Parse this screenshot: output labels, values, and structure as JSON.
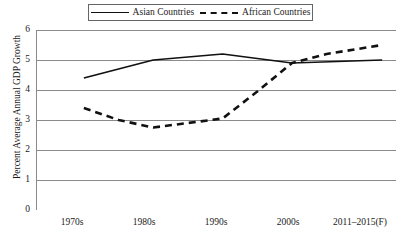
{
  "chart_data": {
    "type": "line",
    "title": "",
    "subtitle": "",
    "xlabel": "",
    "ylabel": "Percent Average Annual GDP Growth",
    "categories": [
      "1970s",
      "1980s",
      "1990s",
      "2000s",
      "2011–2015(F)"
    ],
    "ylim": [
      0,
      6
    ],
    "ytick_labels": [
      "6",
      "5",
      "4",
      "3",
      "2",
      "1",
      "0"
    ],
    "ytick_values": [
      6,
      5,
      4,
      3,
      2,
      1,
      0
    ],
    "grid": "horizontal",
    "grid_color": "#8a8a8a",
    "legend_position": "top-center",
    "series": [
      {
        "name": "Asian Countries",
        "style": "solid",
        "color": "#111111",
        "values": [
          4.4,
          5.0,
          5.2,
          4.9,
          5.0
        ],
        "points": [
          {
            "x": 1970,
            "y": 4.4
          },
          {
            "x": 1980,
            "y": 5.0
          },
          {
            "x": 1990,
            "y": 5.2
          },
          {
            "x": 2000,
            "y": 4.9
          },
          {
            "x": 2013,
            "y": 5.0
          }
        ]
      },
      {
        "name": "African Countries",
        "style": "dashed",
        "color": "#111111",
        "values": [
          3.4,
          2.75,
          3.05,
          4.9,
          5.5
        ],
        "points": [
          {
            "x": 1970,
            "y": 3.4
          },
          {
            "x": 1975,
            "y": 3.0
          },
          {
            "x": 1980,
            "y": 2.75
          },
          {
            "x": 1985,
            "y": 2.9
          },
          {
            "x": 1990,
            "y": 3.05
          },
          {
            "x": 1995,
            "y": 3.95
          },
          {
            "x": 2000,
            "y": 4.9
          },
          {
            "x": 2005,
            "y": 5.2
          },
          {
            "x": 2013,
            "y": 5.5
          }
        ]
      }
    ]
  },
  "legend": {
    "entries": [
      {
        "label": "Asian Countries",
        "style": "solid"
      },
      {
        "label": "African Countries",
        "style": "dashed"
      }
    ]
  }
}
